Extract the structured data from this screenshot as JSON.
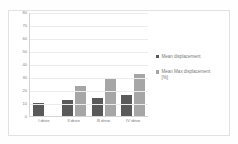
{
  "chart_data": {
    "type": "bar",
    "title": "",
    "subtitle": "",
    "xlabel": "",
    "ylabel": "",
    "ylim": [
      0,
      80
    ],
    "yticks": [
      80,
      70,
      60,
      50,
      40,
      30,
      20,
      10,
      0
    ],
    "categories": [
      "I drive",
      "II drive",
      "III drive",
      "IV drive"
    ],
    "grid": true,
    "legend_position": "right",
    "series": [
      {
        "name": "Mean displacement",
        "color": "#595959",
        "values": [
          10,
          12,
          14,
          16
        ]
      },
      {
        "name": "Mean Max displacement",
        "name_line2": "[%]",
        "color": "#a6a6a6",
        "values": [
          null,
          23,
          28.5,
          32
        ]
      }
    ]
  },
  "colors": {
    "series1": "#595959",
    "series2": "#a6a6a6",
    "gridline": "#ececec",
    "axis": "#d4d4d4",
    "frame": "#e2e2e2",
    "text": "#7a7a7a",
    "background": "#ffffff"
  }
}
